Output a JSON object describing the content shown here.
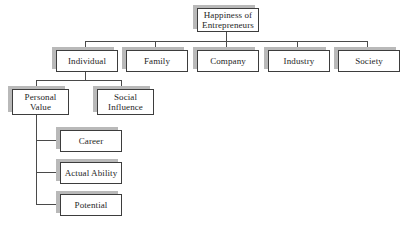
{
  "diagram": {
    "colors": {
      "background": "#ffffff",
      "box_fill": "#ffffff",
      "box_border": "#3d3d3d",
      "shadow": "#b9b9b9",
      "line": "#4a4a4a",
      "text": "#262626"
    },
    "nodes": {
      "root": "Happiness of\nEntrepreneurs",
      "individual": "Individual",
      "family": "Family",
      "company": "Company",
      "industry": "Industry",
      "society": "Society",
      "personal_value": "Personal\nValue",
      "social_influence": "Social\nInfluence",
      "career": "Career",
      "actual_ability": "Actual Ability",
      "potential": "Potential"
    }
  }
}
